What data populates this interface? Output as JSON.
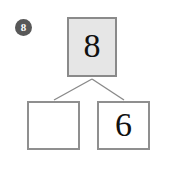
{
  "problem": {
    "number_badge": "8",
    "badge_color": "#585858",
    "badge_text_color": "#ffffff"
  },
  "number_bond": {
    "whole": {
      "label": "8",
      "fill_color": "#e6e6e6",
      "border_color": "#8a8a8a",
      "filled_in": true
    },
    "parts": [
      {
        "label": "",
        "fill_color": "#ffffff",
        "border_color": "#8f8f8f",
        "filled_in": false
      },
      {
        "label": "6",
        "fill_color": "#ffffff",
        "border_color": "#8f8f8f",
        "filled_in": true
      }
    ],
    "connector_color": "#8a8a8a"
  }
}
